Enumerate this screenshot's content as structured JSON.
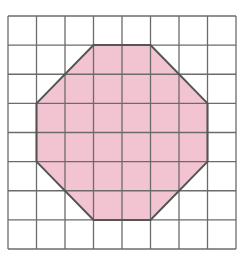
{
  "diagram": {
    "type": "grid-octagon",
    "grid": {
      "columns": 8,
      "rows": 8,
      "origin_px": [
        8,
        16
      ],
      "extent_px": [
        236,
        249
      ],
      "line_color": "#6b6b6b",
      "background": "#ffffff"
    },
    "shape": {
      "name": "octagon",
      "fill": "#f2c4d2",
      "stroke": "#555555",
      "vertices_grid": [
        [
          3,
          1
        ],
        [
          5,
          1
        ],
        [
          7,
          3
        ],
        [
          7,
          5
        ],
        [
          5,
          7
        ],
        [
          3,
          7
        ],
        [
          1,
          5
        ],
        [
          1,
          3
        ]
      ]
    }
  }
}
